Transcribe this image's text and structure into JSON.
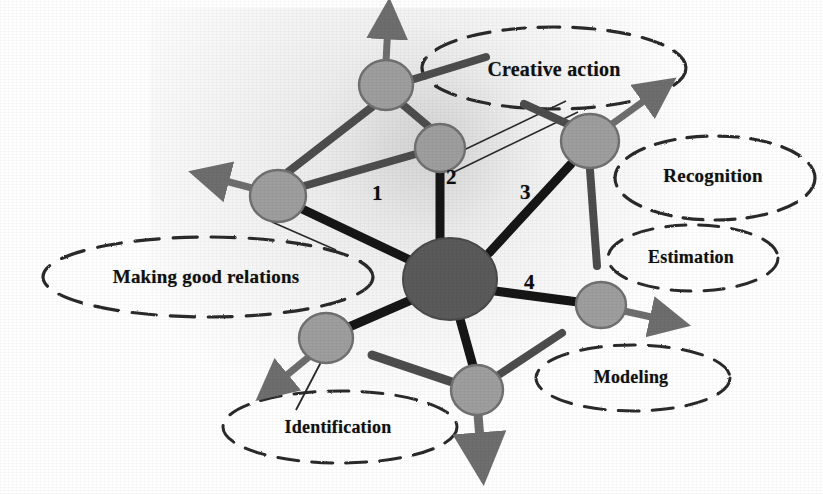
{
  "figure": {
    "background_color": "#ffffff",
    "hub_color": "#5a5a5a",
    "node_color": "#9e9e9e",
    "node_stroke_color": "#6f6f6f",
    "spoke_color": "#141414",
    "arrow_color": "#6e6e6e",
    "ellipse_stroke_color": "#2b2b2b",
    "label_color": "#111111"
  },
  "hub": {
    "label": "",
    "cx": 450,
    "cy": 279,
    "rx": 47,
    "ry": 41
  },
  "nodes": [
    {
      "id": "node-top",
      "label": "",
      "cx": 386,
      "cy": 85,
      "rx": 27,
      "ry": 25
    },
    {
      "id": "node-upper-middle",
      "label": "",
      "cx": 440,
      "cy": 148,
      "rx": 25,
      "ry": 24
    },
    {
      "id": "node-left",
      "label": "",
      "cx": 278,
      "cy": 196,
      "rx": 28,
      "ry": 26
    },
    {
      "id": "node-upper-right",
      "label": "",
      "cx": 590,
      "cy": 141,
      "rx": 29,
      "ry": 27
    },
    {
      "id": "node-lower-left",
      "label": "",
      "cx": 326,
      "cy": 338,
      "rx": 27,
      "ry": 25
    },
    {
      "id": "node-bottom",
      "label": "",
      "cx": 477,
      "cy": 390,
      "rx": 26,
      "ry": 25
    },
    {
      "id": "node-lower-right",
      "label": "",
      "cx": 601,
      "cy": 305,
      "rx": 25,
      "ry": 23
    }
  ],
  "spoke_numbers": [
    {
      "id": "spoke-number-1",
      "text": "1",
      "x": 379,
      "y": 193
    },
    {
      "id": "spoke-number-2",
      "text": "2",
      "x": 453,
      "y": 177
    },
    {
      "id": "spoke-number-3",
      "text": "3",
      "x": 527,
      "y": 192
    },
    {
      "id": "spoke-number-4",
      "text": "4",
      "x": 531,
      "y": 282
    }
  ],
  "callouts": [
    {
      "id": "callout-creative-action",
      "label": "Creative action",
      "cx": 554,
      "cy": 68,
      "rx": 132,
      "ry": 41,
      "text_x": 554,
      "text_y": 69,
      "font_size": 20
    },
    {
      "id": "callout-recognition",
      "label": "Recognition",
      "cx": 715,
      "cy": 178,
      "rx": 100,
      "ry": 42,
      "text_x": 713,
      "text_y": 176,
      "font_size": 19
    },
    {
      "id": "callout-estimation",
      "label": "Estimation",
      "cx": 693,
      "cy": 258,
      "rx": 85,
      "ry": 33,
      "text_x": 691,
      "text_y": 257,
      "font_size": 18
    },
    {
      "id": "callout-modeling",
      "label": "Modeling",
      "cx": 633,
      "cy": 378,
      "rx": 97,
      "ry": 33,
      "text_x": 631,
      "text_y": 377,
      "font_size": 18
    },
    {
      "id": "callout-identification",
      "label": "Identification",
      "cx": 340,
      "cy": 427,
      "rx": 117,
      "ry": 36,
      "text_x": 338,
      "text_y": 427,
      "font_size": 18
    },
    {
      "id": "callout-making-good-relations",
      "label": "Making good relations",
      "cx": 208,
      "cy": 277,
      "rx": 165,
      "ry": 40,
      "text_x": 206,
      "text_y": 277,
      "font_size": 19
    }
  ],
  "spokes": [
    {
      "id": "spoke-hub-to-left",
      "x1": 410,
      "y1": 262,
      "x2": 300,
      "y2": 209,
      "width": 9
    },
    {
      "id": "spoke-hub-to-upper-mid",
      "x1": 440,
      "y1": 240,
      "x2": 440,
      "y2": 172,
      "width": 9
    },
    {
      "id": "spoke-hub-to-upper-right",
      "x1": 489,
      "y1": 254,
      "x2": 570,
      "y2": 164,
      "width": 9
    },
    {
      "id": "spoke-hub-to-lower-right",
      "x1": 494,
      "y1": 292,
      "x2": 578,
      "y2": 302,
      "width": 9
    },
    {
      "id": "spoke-hub-to-bottom",
      "x1": 460,
      "y1": 319,
      "x2": 472,
      "y2": 366,
      "width": 9
    },
    {
      "id": "spoke-hub-to-lower-left",
      "x1": 411,
      "y1": 300,
      "x2": 348,
      "y2": 327,
      "width": 9
    },
    {
      "id": "spoke-left-to-top",
      "x1": 288,
      "y1": 172,
      "x2": 372,
      "y2": 107,
      "width": 8
    },
    {
      "id": "spoke-left-to-upper-mid",
      "x1": 304,
      "y1": 186,
      "x2": 416,
      "y2": 154,
      "width": 8
    },
    {
      "id": "spoke-top-to-upper-mid",
      "x1": 400,
      "y1": 107,
      "x2": 428,
      "y2": 127,
      "width": 8
    },
    {
      "id": "spoke-top-to-upper-right",
      "x1": 410,
      "y1": 80,
      "x2": 480,
      "y2": 58,
      "width": 8
    },
    {
      "id": "spoke-upper-right-branch",
      "x1": 540,
      "y1": 112,
      "x2": 570,
      "y2": 126,
      "width": 8
    },
    {
      "id": "spoke-upper-right-vert",
      "x1": 590,
      "y1": 170,
      "x2": 596,
      "y2": 264,
      "width": 8
    },
    {
      "id": "spoke-bottom-to-lower-rt",
      "x1": 497,
      "y1": 376,
      "x2": 560,
      "y2": 334,
      "width": 8
    },
    {
      "id": "spoke-bottom-left-diag",
      "x1": 452,
      "y1": 382,
      "x2": 372,
      "y2": 355,
      "width": 9
    }
  ],
  "arrows": [
    {
      "id": "arrow-up-from-top-node",
      "x1": 386,
      "y1": 62,
      "x2": 388,
      "y2": 16,
      "direction": "up"
    },
    {
      "id": "arrow-left-from-left-node",
      "x1": 252,
      "y1": 188,
      "x2": 206,
      "y2": 176,
      "direction": "left"
    },
    {
      "id": "arrow-upright-from-right",
      "x1": 612,
      "y1": 124,
      "x2": 662,
      "y2": 88,
      "direction": "up-right"
    },
    {
      "id": "arrow-right-from-lower-right",
      "x1": 624,
      "y1": 311,
      "x2": 672,
      "y2": 322,
      "direction": "right"
    },
    {
      "id": "arrow-down-from-bottom-node",
      "x1": 478,
      "y1": 414,
      "x2": 482,
      "y2": 462,
      "direction": "down"
    },
    {
      "id": "arrow-downleft-from-lowleft",
      "x1": 310,
      "y1": 356,
      "x2": 268,
      "y2": 390,
      "direction": "down-left"
    }
  ],
  "thin_lines": [
    {
      "id": "thin-line-upper-mid-to-right",
      "x1": 443,
      "y1": 160,
      "x2": 566,
      "y2": 101
    },
    {
      "id": "thin-line-right-to-upper-mid",
      "x1": 452,
      "y1": 173,
      "x2": 578,
      "y2": 112
    },
    {
      "id": "thin-line-lowleft-to-ident",
      "x1": 344,
      "y1": 318,
      "x2": 296,
      "y2": 410
    },
    {
      "id": "thin-line-left-to-relations",
      "x1": 272,
      "y1": 222,
      "x2": 336,
      "y2": 250
    }
  ]
}
